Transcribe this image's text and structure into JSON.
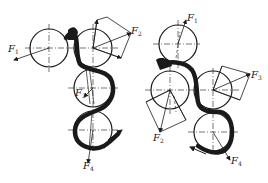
{
  "diagram": {
    "type": "gear-train force analysis",
    "colors": {
      "line": "#1a1a1a",
      "background": "#ffffff"
    },
    "left_assembly": {
      "labels": [
        {
          "id": "F1",
          "base": "F",
          "sub": "1",
          "x": 8,
          "y": 44
        },
        {
          "id": "F2",
          "base": "F",
          "sub": "2",
          "x": 131,
          "y": 26
        },
        {
          "id": "F3",
          "base": "F",
          "sub": "3",
          "x": 75,
          "y": 88
        },
        {
          "id": "F4",
          "base": "F",
          "sub": "4",
          "x": 83,
          "y": 161
        }
      ]
    },
    "right_assembly": {
      "labels": [
        {
          "id": "F1",
          "base": "F",
          "sub": "1",
          "x": 187,
          "y": 13
        },
        {
          "id": "F2",
          "base": "F",
          "sub": "2",
          "x": 153,
          "y": 133
        },
        {
          "id": "F3",
          "base": "F",
          "sub": "3",
          "x": 251,
          "y": 70
        },
        {
          "id": "F4",
          "base": "F",
          "sub": "4",
          "x": 231,
          "y": 156
        }
      ]
    }
  }
}
